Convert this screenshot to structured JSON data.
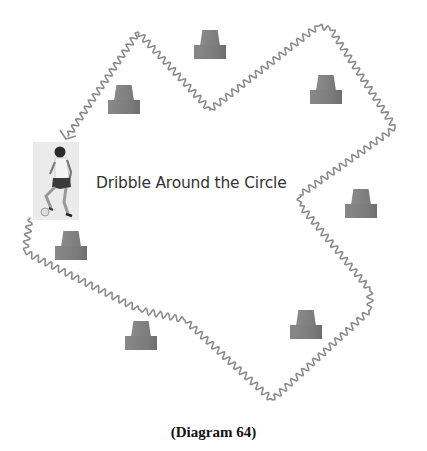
{
  "diagram": {
    "label": "Dribble Around the Circle",
    "caption": "(Diagram 64)",
    "colors": {
      "cone": "#808080",
      "path": "#8c8c8c",
      "text": "#333333",
      "background": "#ffffff"
    },
    "player": {
      "icon": "soccer-player-dribbling-icon",
      "x": 33,
      "y": 142,
      "w": 46,
      "h": 78
    },
    "cones": [
      {
        "id": "cone-top-center",
        "x": 194,
        "y": 30
      },
      {
        "id": "cone-upper-left",
        "x": 108,
        "y": 85
      },
      {
        "id": "cone-upper-right",
        "x": 310,
        "y": 75
      },
      {
        "id": "cone-right",
        "x": 345,
        "y": 189
      },
      {
        "id": "cone-left",
        "x": 55,
        "y": 231
      },
      {
        "id": "cone-lower-left",
        "x": 125,
        "y": 321
      },
      {
        "id": "cone-lower-right",
        "x": 290,
        "y": 310
      }
    ],
    "path": {
      "style": "wavy-line",
      "direction": "counter-clockwise",
      "waypoints": [
        [
          30,
          218
        ],
        [
          25,
          252
        ],
        [
          140,
          310
        ],
        [
          185,
          320
        ],
        [
          272,
          400
        ],
        [
          370,
          310
        ],
        [
          370,
          290
        ],
        [
          300,
          205
        ],
        [
          300,
          195
        ],
        [
          395,
          128
        ],
        [
          330,
          28
        ],
        [
          318,
          26
        ],
        [
          210,
          110
        ],
        [
          138,
          32
        ],
        [
          68,
          136
        ]
      ],
      "arrow": "arrowhead-icon"
    }
  }
}
